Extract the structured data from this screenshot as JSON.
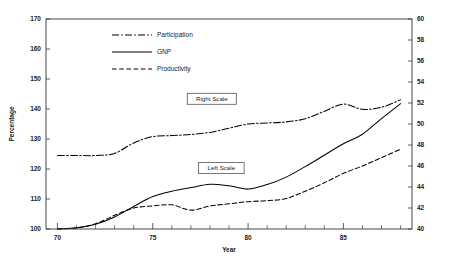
{
  "chart_data": {
    "type": "line",
    "title": "",
    "xlabel": "Year",
    "ylabel": "Percentage",
    "y2label": "",
    "xlim": [
      69.4,
      88.6
    ],
    "ylim": [
      100,
      170
    ],
    "y2lim": [
      40,
      60
    ],
    "grid": false,
    "legend_position": "upper-left-inside",
    "x": [
      70,
      71,
      72,
      73,
      74,
      75,
      76,
      77,
      78,
      79,
      80,
      81,
      82,
      83,
      84,
      85,
      86,
      87,
      88
    ],
    "xticks": [
      70,
      75,
      80,
      85
    ],
    "xticklabels": [
      "70",
      "75",
      "80",
      "85"
    ],
    "xminortick_step": 1,
    "yticks": [
      100,
      110,
      120,
      130,
      140,
      150,
      160,
      170
    ],
    "yticklabels": [
      "100",
      "110",
      "120",
      "130",
      "140",
      "150",
      "160",
      "170"
    ],
    "y2ticks": [
      40,
      42,
      44,
      46,
      48,
      50,
      52,
      54,
      56,
      58,
      60
    ],
    "y2ticklabels": [
      "40",
      "42",
      "44",
      "46",
      "48",
      "50",
      "52",
      "54",
      "56",
      "58",
      "60"
    ],
    "series": [
      {
        "name": "Participation",
        "axis": "right",
        "style": "dashdot",
        "dasharray": "7,2.2,1.6,2.2",
        "values": [
          47.0,
          47.0,
          47.0,
          47.2,
          48.2,
          48.8,
          48.9,
          49.0,
          49.2,
          49.6,
          50.0,
          50.1,
          50.2,
          50.5,
          51.2,
          51.9,
          51.4,
          51.6,
          52.3
        ]
      },
      {
        "name": "GNP",
        "axis": "left",
        "style": "solid",
        "dasharray": "none",
        "values": [
          100.0,
          100.4,
          101.6,
          104.0,
          107.5,
          110.8,
          112.6,
          113.8,
          114.9,
          114.4,
          113.3,
          114.8,
          117.3,
          120.8,
          124.6,
          128.4,
          131.6,
          136.8,
          141.8
        ]
      },
      {
        "name": "Productivity",
        "axis": "right",
        "style": "dashed",
        "dasharray": "4.6,2.6",
        "values": [
          40.0,
          40.1,
          40.5,
          41.3,
          42.0,
          42.2,
          42.3,
          41.8,
          42.2,
          42.4,
          42.6,
          42.7,
          42.9,
          43.6,
          44.4,
          45.3,
          46.0,
          46.8,
          47.6
        ]
      }
    ],
    "annotations": [
      {
        "text": "Right Scale",
        "x": 78.1,
        "y_left": 143.4
      },
      {
        "text": "Left Scale",
        "x": 78.6,
        "y_left": 120.3
      }
    ]
  },
  "legend": {
    "entries": [
      {
        "label": "Participation",
        "style": "dashdot"
      },
      {
        "label": "GNP",
        "style": "solid"
      },
      {
        "label": "Productivity",
        "style": "dashed"
      }
    ]
  }
}
